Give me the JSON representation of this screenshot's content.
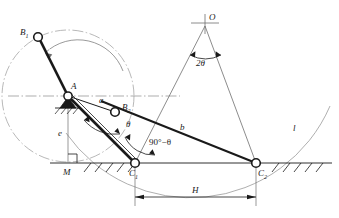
{
  "figure": {
    "kind": "kinematic-diagram",
    "background_color": "#ffffff",
    "line_color": "#1a1a1a",
    "thin_line_color": "#6e6e6e",
    "arc_color": "#8a8a8a"
  },
  "labels": {
    "B1": "B",
    "B1_sub": "1",
    "B2": "B",
    "B2_sub": "2",
    "A": "A",
    "O": "O",
    "M": "M",
    "C1": "C",
    "C1_sub": "1",
    "C2": "C",
    "C2_sub": "2",
    "a": "a",
    "b": "b",
    "e": "e",
    "l": "l",
    "H": "H",
    "theta": "θ",
    "two_theta": "2θ",
    "ninety_minus_theta": "90°−θ"
  },
  "geometry": {
    "points": {
      "A": {
        "x": 68,
        "y": 96
      },
      "B1": {
        "x": 38,
        "y": 37
      },
      "B2": {
        "x": 115,
        "y": 112
      },
      "O": {
        "x": 205,
        "y": 23
      },
      "M": {
        "x": 68,
        "y": 163
      },
      "C1": {
        "x": 135,
        "y": 163
      },
      "C2": {
        "x": 256,
        "y": 163
      }
    },
    "ground_line_y": 163,
    "dimension_line_y": 197,
    "crank_circle_radius": 66,
    "axis_line_y": 96
  }
}
